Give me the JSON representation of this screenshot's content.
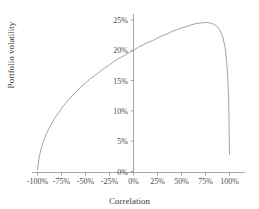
{
  "chart_data": {
    "type": "line",
    "title": "",
    "xlabel": "Correlation",
    "ylabel": "Portfolio volatility",
    "xlim": [
      -100,
      100
    ],
    "ylim": [
      0,
      26.5
    ],
    "xtick_labels": [
      "-100%",
      "-75%",
      "-50%",
      "-25%",
      "0%",
      "25%",
      "50%",
      "75%",
      "100%"
    ],
    "xticks": [
      -100,
      -75,
      -50,
      -25,
      0,
      25,
      50,
      75,
      100
    ],
    "ytick_labels": [
      "0%",
      "5%",
      "10%",
      "15%",
      "20%",
      "25%"
    ],
    "yticks": [
      0,
      5,
      10,
      15,
      20,
      25
    ],
    "grid": false,
    "legend": null,
    "series": [
      {
        "name": "Portfolio volatility",
        "color": "#9a9a9a",
        "x": [
          -100,
          -98,
          -96,
          -94,
          -92,
          -90,
          -86,
          -82,
          -78,
          -74,
          -70,
          -65,
          -60,
          -55,
          -50,
          -45,
          -40,
          -35,
          -30,
          -25,
          -20,
          -15,
          -10,
          -5,
          0,
          5,
          10,
          15,
          20,
          25,
          30,
          35,
          40,
          45,
          50,
          55,
          60,
          65,
          70,
          75,
          80,
          84,
          88,
          91,
          93,
          95,
          96,
          97,
          98,
          99,
          99.5,
          100
        ],
        "y": [
          0.3,
          2.6,
          3.9,
          4.9,
          5.8,
          6.5,
          7.7,
          8.8,
          9.7,
          10.6,
          11.4,
          12.3,
          13.1,
          13.9,
          14.6,
          15.3,
          15.9,
          16.5,
          17.1,
          17.6,
          18.2,
          18.7,
          19.1,
          19.6,
          20.0,
          20.5,
          20.9,
          21.3,
          21.6,
          22.0,
          22.4,
          22.7,
          23.1,
          23.4,
          23.7,
          23.9,
          24.2,
          24.4,
          24.5,
          24.6,
          24.5,
          24.3,
          23.8,
          23.0,
          22.2,
          20.8,
          19.7,
          18.2,
          16.0,
          12.5,
          8.5,
          2.8
        ]
      }
    ]
  },
  "axis": {
    "x_title": "Correlation",
    "y_title": "Portfolio volatility"
  }
}
